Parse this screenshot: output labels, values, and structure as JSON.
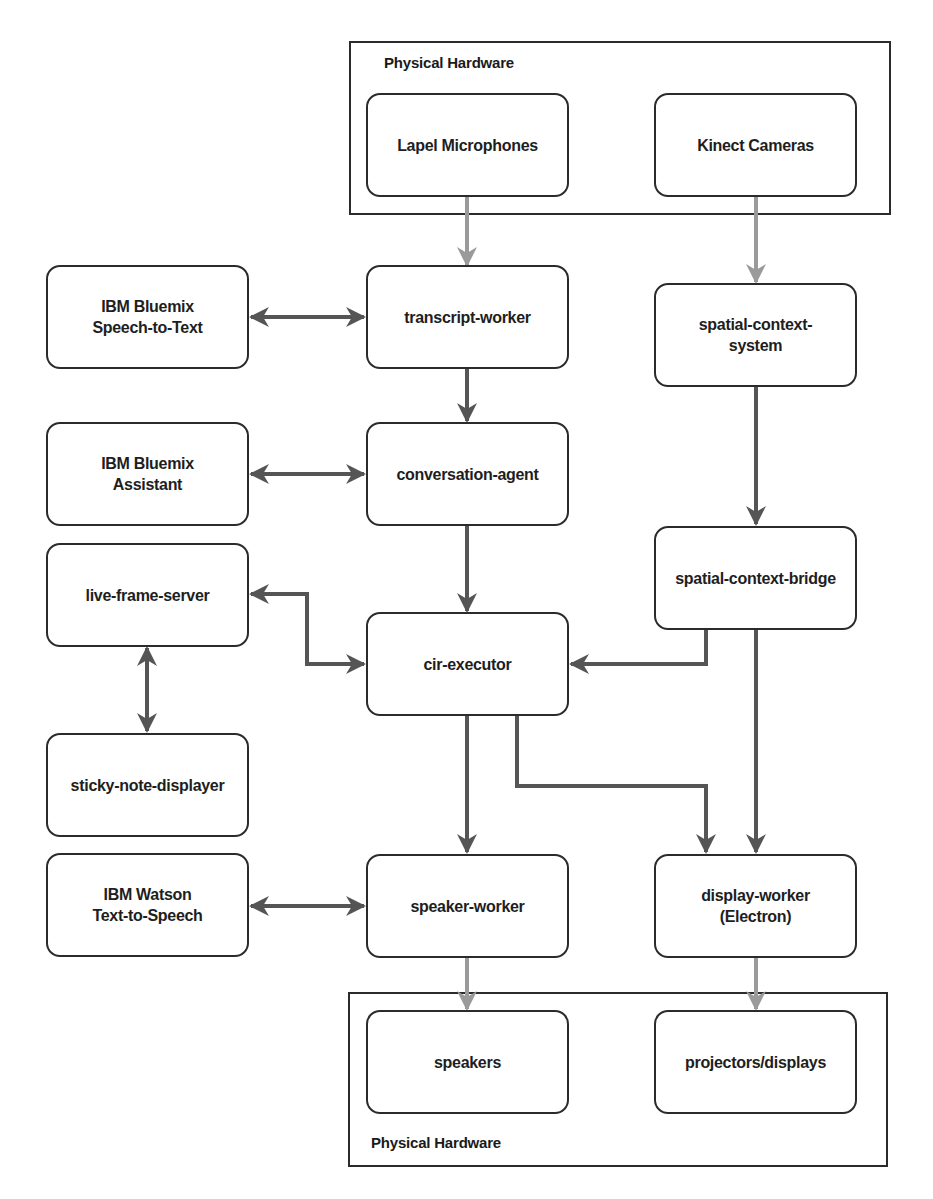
{
  "diagram": {
    "colors": {
      "edge_dark": "#555555",
      "edge_light": "#9a9a9a",
      "node_border": "#2b2b2b",
      "background": "#ffffff"
    },
    "frames": [
      {
        "id": "hw-top",
        "label": "Physical Hardware",
        "label_position": "top-left"
      },
      {
        "id": "hw-bottom",
        "label": "Physical Hardware",
        "label_position": "bottom-left"
      }
    ],
    "nodes": {
      "lapel_microphones": {
        "label": "Lapel Microphones",
        "group": "hw-top"
      },
      "kinect_cameras": {
        "label": "Kinect Cameras",
        "group": "hw-top"
      },
      "ibm_stt": {
        "label": "IBM Bluemix\nSpeech-to-Text"
      },
      "transcript_worker": {
        "label": "transcript-worker"
      },
      "spatial_context_system": {
        "label": "spatial-context-\nsystem"
      },
      "ibm_assistant": {
        "label": "IBM Bluemix\nAssistant"
      },
      "conversation_agent": {
        "label": "conversation-agent"
      },
      "live_frame_server": {
        "label": "live-frame-server"
      },
      "spatial_context_bridge": {
        "label": "spatial-context-bridge"
      },
      "cir_executor": {
        "label": "cir-executor"
      },
      "sticky_note_displayer": {
        "label": "sticky-note-displayer"
      },
      "ibm_tts": {
        "label": "IBM Watson\nText-to-Speech"
      },
      "speaker_worker": {
        "label": "speaker-worker"
      },
      "display_worker": {
        "label": "display-worker\n(Electron)"
      },
      "speakers": {
        "label": "speakers",
        "group": "hw-bottom"
      },
      "projectors_displays": {
        "label": "projectors/displays",
        "group": "hw-bottom"
      }
    },
    "edges": [
      {
        "from": "lapel_microphones",
        "to": "transcript_worker",
        "style": "light",
        "direction": "forward"
      },
      {
        "from": "kinect_cameras",
        "to": "spatial_context_system",
        "style": "light",
        "direction": "forward"
      },
      {
        "from": "ibm_stt",
        "to": "transcript_worker",
        "style": "dark",
        "direction": "both"
      },
      {
        "from": "transcript_worker",
        "to": "conversation_agent",
        "style": "dark",
        "direction": "forward"
      },
      {
        "from": "spatial_context_system",
        "to": "spatial_context_bridge",
        "style": "dark",
        "direction": "forward"
      },
      {
        "from": "ibm_assistant",
        "to": "conversation_agent",
        "style": "dark",
        "direction": "both"
      },
      {
        "from": "conversation_agent",
        "to": "cir_executor",
        "style": "dark",
        "direction": "forward"
      },
      {
        "from": "live_frame_server",
        "to": "cir_executor",
        "style": "dark",
        "direction": "both"
      },
      {
        "from": "spatial_context_bridge",
        "to": "cir_executor",
        "style": "dark",
        "direction": "forward"
      },
      {
        "from": "live_frame_server",
        "to": "sticky_note_displayer",
        "style": "dark",
        "direction": "both"
      },
      {
        "from": "cir_executor",
        "to": "speaker_worker",
        "style": "dark",
        "direction": "forward"
      },
      {
        "from": "cir_executor",
        "to": "display_worker",
        "style": "dark",
        "direction": "forward"
      },
      {
        "from": "spatial_context_bridge",
        "to": "display_worker",
        "style": "dark",
        "direction": "forward"
      },
      {
        "from": "ibm_tts",
        "to": "speaker_worker",
        "style": "dark",
        "direction": "both"
      },
      {
        "from": "speaker_worker",
        "to": "speakers",
        "style": "light",
        "direction": "forward"
      },
      {
        "from": "display_worker",
        "to": "projectors_displays",
        "style": "light",
        "direction": "forward"
      }
    ]
  }
}
